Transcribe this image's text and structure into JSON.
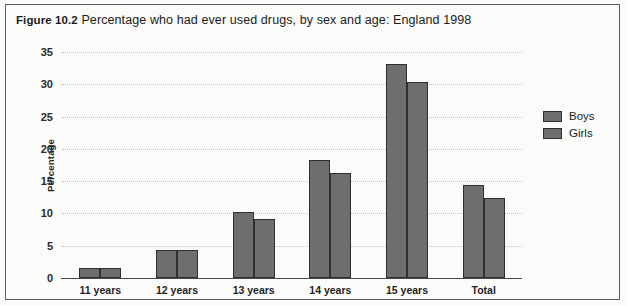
{
  "figure": {
    "number": "Figure 10.2",
    "caption": "Percentage who had ever used drugs, by sex and age: England 1998"
  },
  "chart_data": {
    "type": "bar",
    "title": "Percentage who had ever used drugs, by sex and age: England 1998",
    "xlabel": "",
    "ylabel": "Percentage",
    "ylim": [
      0,
      35
    ],
    "yticks": [
      0,
      5,
      10,
      15,
      20,
      25,
      30,
      35
    ],
    "grid": true,
    "legend_position": "right",
    "categories": [
      "11 years",
      "12 years",
      "13 years",
      "14 years",
      "15 years",
      "Total"
    ],
    "series": [
      {
        "name": "Boys",
        "color": "#6e6e6e",
        "values": [
          1.6,
          4.4,
          10.3,
          18.2,
          33.2,
          14.4
        ]
      },
      {
        "name": "Girls",
        "color": "#6e6e6e",
        "values": [
          1.5,
          4.4,
          9.2,
          16.2,
          30.3,
          12.4
        ]
      }
    ]
  },
  "legend": {
    "items": [
      {
        "label": "Boys"
      },
      {
        "label": "Girls"
      }
    ]
  }
}
